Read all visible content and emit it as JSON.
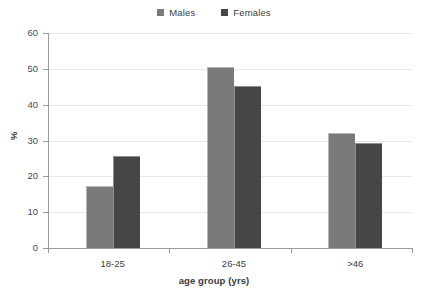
{
  "chart_data": {
    "type": "bar",
    "title": "",
    "categories": [
      "18-25",
      "26-45",
      ">46"
    ],
    "series": [
      {
        "name": "Males",
        "color": "#7a7a7a",
        "values": [
          17.3,
          50.6,
          32.2
        ]
      },
      {
        "name": "Females",
        "color": "#464646",
        "values": [
          25.6,
          45.2,
          29.4
        ]
      }
    ],
    "xlabel": "age group (yrs)",
    "ylabel": "%",
    "ylim": [
      0,
      60
    ],
    "yticks": [
      0,
      10,
      20,
      30,
      40,
      50,
      60
    ],
    "ytick_labels": [
      "0",
      "10",
      "20",
      "30",
      "40",
      "50",
      "60"
    ],
    "grid": true,
    "legend_position": "top-center"
  },
  "legend": {
    "entries": [
      {
        "label": "Males",
        "color": "#7a7a7a"
      },
      {
        "label": "Females",
        "color": "#464646"
      }
    ]
  },
  "axes": {
    "y_title": "%",
    "x_title": "age group (yrs)"
  }
}
